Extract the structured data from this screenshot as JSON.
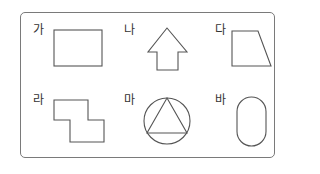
{
  "stroke_color": "#555555",
  "frame_color": "#7a7a7a",
  "items": [
    {
      "label": "가",
      "shape": "rectangle"
    },
    {
      "label": "나",
      "shape": "arrow-up"
    },
    {
      "label": "다",
      "shape": "trapezoid"
    },
    {
      "label": "라",
      "shape": "z-shaped-polygon"
    },
    {
      "label": "마",
      "shape": "triangle-inscribed-in-circle"
    },
    {
      "label": "바",
      "shape": "stadium-oval"
    }
  ]
}
